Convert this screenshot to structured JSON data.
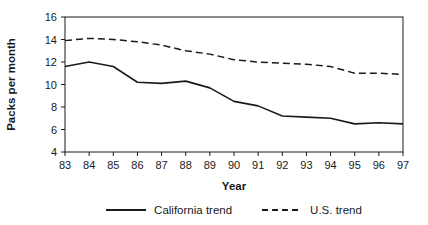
{
  "chart_data": {
    "type": "line",
    "title": "",
    "xlabel": "Year",
    "ylabel": "Packs per month",
    "x": [
      83,
      84,
      85,
      86,
      87,
      88,
      89,
      90,
      91,
      92,
      93,
      94,
      95,
      96,
      97
    ],
    "xtick_labels": [
      "83",
      "84",
      "85",
      "86",
      "87",
      "88",
      "89",
      "90",
      "91",
      "92",
      "93",
      "94",
      "95",
      "96",
      "97"
    ],
    "yticks": [
      4,
      6,
      8,
      10,
      12,
      14,
      16
    ],
    "ylim": [
      4,
      16
    ],
    "grid": false,
    "legend_position": "bottom",
    "line_color": "#1a1a1a",
    "series": [
      {
        "name": "California trend",
        "style": "solid",
        "values": [
          11.6,
          12.0,
          11.6,
          10.2,
          10.1,
          10.3,
          9.7,
          8.5,
          8.1,
          7.2,
          7.1,
          7.0,
          6.5,
          6.6,
          6.5
        ]
      },
      {
        "name": "U.S. trend",
        "style": "dashed",
        "values": [
          13.9,
          14.1,
          14.0,
          13.8,
          13.5,
          13.0,
          12.7,
          12.2,
          12.0,
          11.9,
          11.8,
          11.6,
          11.0,
          11.0,
          10.9
        ]
      }
    ]
  }
}
